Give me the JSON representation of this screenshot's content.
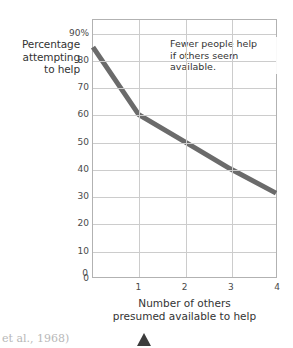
{
  "chart_data": {
    "type": "line",
    "title": "",
    "xlabel": "Number of others presumed available to help",
    "ylabel": "Percentage attempting to help",
    "x": [
      0,
      1,
      2,
      3,
      4
    ],
    "values": [
      85,
      60,
      50,
      40,
      31
    ],
    "series": [
      {
        "name": "Percentage attempting to help",
        "values": [
          85,
          60,
          50,
          40,
          31
        ]
      }
    ],
    "categories": [
      "0",
      "1",
      "2",
      "3",
      "4"
    ],
    "xlim": [
      0,
      4
    ],
    "ylim": [
      0,
      95
    ],
    "grid": true,
    "legend": "none",
    "line_color": "#6b6b6b",
    "grid_color": "#cccccc",
    "border_color": "#b2b2b2",
    "y_ticks": [
      {
        "value": 90,
        "label": "90%"
      },
      {
        "value": 80,
        "label": "80"
      },
      {
        "value": 70,
        "label": "70"
      },
      {
        "value": 60,
        "label": "60"
      },
      {
        "value": 50,
        "label": "50"
      },
      {
        "value": 40,
        "label": "40"
      },
      {
        "value": 30,
        "label": "30"
      },
      {
        "value": 20,
        "label": "20"
      },
      {
        "value": 10,
        "label": "10"
      },
      {
        "value": 0,
        "label": "0"
      }
    ],
    "x_ticks": [
      {
        "value": 1,
        "label": "1"
      },
      {
        "value": 2,
        "label": "2"
      },
      {
        "value": 3,
        "label": "3"
      },
      {
        "value": 4,
        "label": "4"
      }
    ],
    "x_zero_label": "0",
    "annotations": [
      {
        "name": "callout",
        "lines": [
          "Fewer people help",
          "if others seem",
          "available."
        ]
      }
    ]
  },
  "axis_titles": {
    "y_lines": [
      "Percentage",
      "attempting",
      "to help"
    ],
    "x_lines": [
      "Number of others",
      "presumed available to help"
    ]
  },
  "caption": {
    "source_text": "et al., 1968)"
  }
}
